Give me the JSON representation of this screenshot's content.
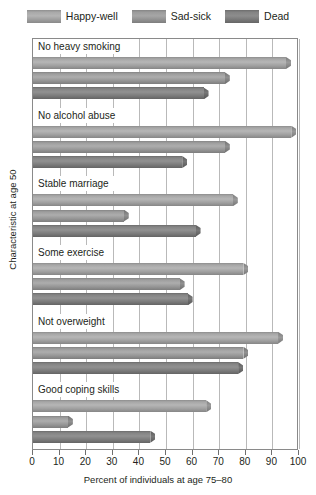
{
  "chart_data": {
    "type": "bar",
    "orientation": "horizontal",
    "title": "",
    "xlabel": "Percent of individuals at age 75–80",
    "ylabel": "Characteristic at age 50",
    "xlim": [
      0,
      100
    ],
    "xticks": [
      0,
      10,
      20,
      30,
      40,
      50,
      60,
      70,
      80,
      90,
      100
    ],
    "grid": true,
    "legend_position": "top",
    "categories": [
      "No heavy smoking",
      "No alcohol abuse",
      "Stable marriage",
      "Some exercise",
      "Not overweight",
      "Good coping skills"
    ],
    "series": [
      {
        "name": "Happy-well",
        "color": "#b0b0b0",
        "values": [
          97,
          99,
          77,
          81,
          94,
          67
        ]
      },
      {
        "name": "Sad-sick",
        "color": "#a0a0a0",
        "values": [
          74,
          74,
          36,
          57,
          81,
          15
        ]
      },
      {
        "name": "Dead",
        "color": "#878787",
        "values": [
          66,
          58,
          63,
          60,
          79,
          46
        ]
      }
    ]
  },
  "legend": {
    "items": [
      {
        "label": "Happy-well"
      },
      {
        "label": "Sad-sick"
      },
      {
        "label": "Dead"
      }
    ]
  },
  "axes": {
    "x_title": "Percent of individuals at age 75–80",
    "y_title": "Characteristic at age 50",
    "x_tick_labels": [
      "0",
      "10",
      "20",
      "30",
      "40",
      "50",
      "60",
      "70",
      "80",
      "90",
      "100"
    ]
  }
}
